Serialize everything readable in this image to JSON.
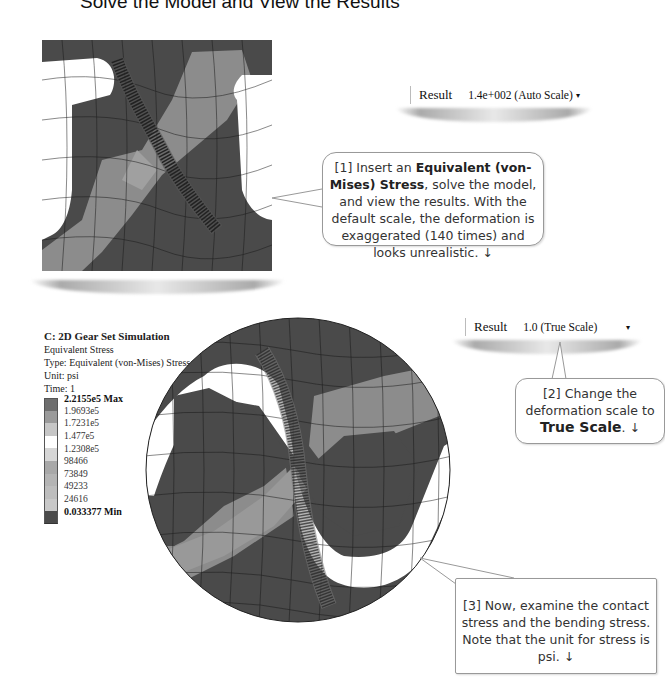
{
  "page": {
    "title": "Solve the Model and View the Results"
  },
  "top_view": {
    "deformation_dropdown": {
      "label": "Result",
      "value": "1.4e+002 (Auto Scale)",
      "caret": "▾"
    },
    "callout": {
      "number": "[1]",
      "text_before": " Insert an ",
      "bold": "Equivalent (von-Mises) Stress",
      "text_after": ", solve the model, and view the results. With the default scale, the deformation is exaggerated (140 times) and looks unrealistic.",
      "arrow": "↓"
    }
  },
  "bottom_view": {
    "header": {
      "title": "C: 2D Gear Set Simulation",
      "line1": "Equivalent Stress",
      "line2": "Type: Equivalent (von-Mises) Stress",
      "line3": "Unit: psi",
      "line4": "Time: 1"
    },
    "legend": {
      "max_label": "2.2155e5 Max",
      "min_label": "0.033377 Min",
      "levels": [
        "2.2155e5 Max",
        "1.9693e5",
        "1.7231e5",
        "1.477e5",
        "1.2308e5",
        "98466",
        "73849",
        "49233",
        "24616",
        "0.033377 Min"
      ],
      "colors": [
        "#6e6e6e",
        "#9a9a9a",
        "#c6c6c6",
        "#ffffff",
        "#d6d6d6",
        "#a8a8a8",
        "#b4b4b4",
        "#bdbdbd",
        "#c8c8c8",
        "#4a4a4a"
      ]
    },
    "deformation_dropdown": {
      "label": "Result",
      "value": "1.0 (True Scale)",
      "caret": "▾"
    },
    "callout2": {
      "number": "[2]",
      "text_before": " Change the deformation scale to ",
      "bold": "True Scale",
      "text_after": ".",
      "arrow": "↓"
    },
    "callout3": {
      "number": "[3]",
      "text": " Now, examine the contact stress and the bending stress.  Note that the unit for stress is psi.",
      "arrow": "↓"
    }
  },
  "colors": {
    "low_stress": "#4a4a4a",
    "mid_stress": "#8c8c8c",
    "high_stress": "#b8b8b8",
    "mesh_line": "#1a1a1a"
  }
}
